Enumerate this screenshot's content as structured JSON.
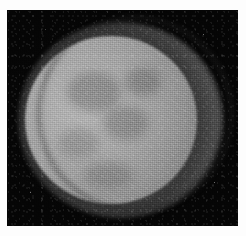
{
  "image": {
    "kind": "grayscale-astronomical-photograph",
    "subject": "lunar-disc",
    "caption": "",
    "title": "",
    "background_color": "#ffffff",
    "plate_color": "#050505",
    "disc_color": "#a8a8a8",
    "halo_color": "#7a7a7a",
    "alt_text": "Grayscale telescopic photograph of a round lunar-like disc with a fainter diffuse outer halo, on a black sky field"
  },
  "labels": {
    "overlay_text": "",
    "scale_bar": "",
    "north_marker": "",
    "annotations": []
  }
}
